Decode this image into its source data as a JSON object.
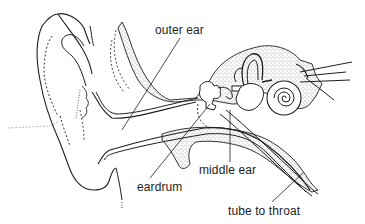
{
  "diagram": {
    "style": "black ink line drawing with stippled bone",
    "colors": {
      "ink": "#1e1e1e",
      "background": "#ffffff",
      "stipple": "#3a3a3a"
    },
    "labels": [
      {
        "id": "outer-ear",
        "text": "outer ear",
        "x": 155,
        "y": 25,
        "pointer_to": [
          122,
          130
        ]
      },
      {
        "id": "eardrum",
        "text": "eardrum",
        "x": 137,
        "y": 182,
        "pointer_to": [
          210,
          102
        ]
      },
      {
        "id": "middle-ear",
        "text": "middle ear",
        "x": 199,
        "y": 166,
        "pointer_to": [
          230,
          110
        ]
      },
      {
        "id": "tube-to-throat",
        "text": "tube to throat",
        "x": 228,
        "y": 206,
        "pointer_to": [
          303,
          174
        ]
      }
    ]
  }
}
